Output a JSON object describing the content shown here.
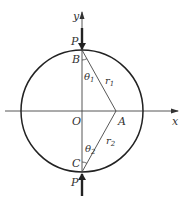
{
  "diagram": {
    "axes": {
      "x_label": "x",
      "y_label": "y",
      "origin_label": "O"
    },
    "points": {
      "B": "B",
      "C": "C",
      "A": "A",
      "P_top": "P",
      "P_bottom": "P"
    },
    "segments": {
      "r1": "r",
      "r1_sub": "1",
      "r2": "r",
      "r2_sub": "2"
    },
    "angles": {
      "theta1": "θ",
      "theta1_sub": "1",
      "theta2": "θ",
      "theta2_sub": "2"
    },
    "colors": {
      "stroke": "#333333"
    }
  }
}
